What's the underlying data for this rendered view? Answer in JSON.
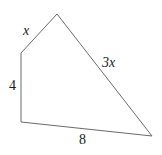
{
  "figure": {
    "type": "quadrilateral-diagram",
    "background_color": "#ffffff",
    "stroke_color": "#6b6b6b",
    "stroke_width": 1,
    "text_color": "#1a1a1a",
    "vertices": [
      {
        "name": "top",
        "x": 57,
        "y": 14
      },
      {
        "name": "bottom-right",
        "x": 152,
        "y": 136
      },
      {
        "name": "bottom-left",
        "x": 21,
        "y": 122
      },
      {
        "name": "left",
        "x": 21,
        "y": 53
      }
    ],
    "polygon_points": "57,14 152,136 21,122 21,53",
    "labels": {
      "upper_left_side": "x",
      "left_side": "4",
      "bottom_side": "8",
      "right_side": "3x"
    }
  }
}
